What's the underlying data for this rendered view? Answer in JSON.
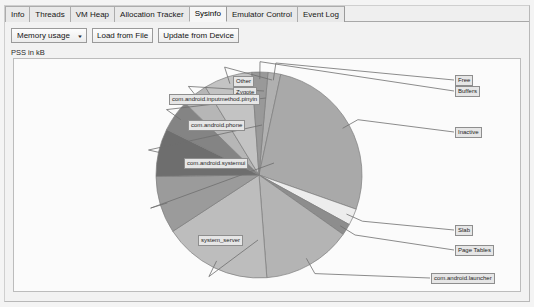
{
  "window": {
    "tabs": [
      {
        "label": "Info",
        "active": false
      },
      {
        "label": "Threads",
        "active": false
      },
      {
        "label": "VM Heap",
        "active": false
      },
      {
        "label": "Allocation Tracker",
        "active": false
      },
      {
        "label": "Sysinfo",
        "active": true
      },
      {
        "label": "Emulator Control",
        "active": false
      },
      {
        "label": "Event Log",
        "active": false
      }
    ]
  },
  "toolbar": {
    "chart_select_value": "Memory usage",
    "chart_select_caret": "▼",
    "load_from_file_label": "Load from File",
    "update_from_device_label": "Update from Device"
  },
  "chart_axis_label": "PSS in kB",
  "chart_data": {
    "type": "pie",
    "title": "PSS in kB",
    "legend_position": "callout-labels",
    "grid": false,
    "start_angle_deg": -85,
    "direction": "clockwise",
    "categories": [
      "Free",
      "Inactive",
      "Slab",
      "Page Tables",
      "com.android.launcher",
      "system_server",
      "com.android.systemui",
      "com.android.phone",
      "com.android.inputmethod.pinyin",
      "Zygote",
      "Other",
      "Buffers"
    ],
    "values": [
      2.0,
      27.0,
      2.6,
      1.8,
      14.0,
      17.0,
      9.0,
      7.5,
      5.0,
      4.0,
      7.6,
      2.5
    ],
    "colors": [
      "#b0b0b0",
      "#a9a9a9",
      "#ededed",
      "#8d8d8d",
      "#b4b4b4",
      "#bdbdbd",
      "#9b9b9b",
      "#6e6e6e",
      "#848484",
      "#b6b6b6",
      "#c3c3c3",
      "#999999"
    ]
  },
  "callouts": [
    {
      "name": "other",
      "label": "Other"
    },
    {
      "name": "zygote",
      "label": "Zygote"
    },
    {
      "name": "pinyin",
      "label": "com.android.inputmethod.pinyin"
    },
    {
      "name": "phone",
      "label": "com.android.phone"
    },
    {
      "name": "systemui",
      "label": "com.android.systemui"
    },
    {
      "name": "system-server",
      "label": "system_server"
    },
    {
      "name": "free",
      "label": "Free"
    },
    {
      "name": "buffers",
      "label": "Buffers"
    },
    {
      "name": "inactive",
      "label": "Inactive"
    },
    {
      "name": "slab",
      "label": "Slab"
    },
    {
      "name": "page-tables",
      "label": "Page Tables"
    },
    {
      "name": "launcher",
      "label": "com.android.launcher"
    }
  ]
}
